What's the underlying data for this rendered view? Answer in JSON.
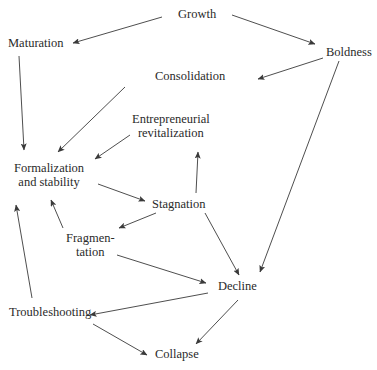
{
  "diagram": {
    "type": "directed-graph",
    "nodes": [
      {
        "id": "growth",
        "lines": [
          "Growth"
        ]
      },
      {
        "id": "maturation",
        "lines": [
          "Maturation"
        ]
      },
      {
        "id": "boldness",
        "lines": [
          "Boldness"
        ]
      },
      {
        "id": "consolidation",
        "lines": [
          "Consolidation"
        ]
      },
      {
        "id": "entrepreneurial",
        "lines": [
          "Entrepreneurial",
          "revitalization"
        ]
      },
      {
        "id": "formalization",
        "lines": [
          "Formalization",
          "and stability"
        ]
      },
      {
        "id": "stagnation",
        "lines": [
          "Stagnation"
        ]
      },
      {
        "id": "fragmentation",
        "lines": [
          "Fragmen-",
          "tation"
        ]
      },
      {
        "id": "decline",
        "lines": [
          "Decline"
        ]
      },
      {
        "id": "troubleshooting",
        "lines": [
          "Troubleshooting"
        ]
      },
      {
        "id": "collapse",
        "lines": [
          "Collapse"
        ]
      }
    ],
    "edges": [
      {
        "from": "growth",
        "to": "maturation"
      },
      {
        "from": "growth",
        "to": "boldness"
      },
      {
        "from": "boldness",
        "to": "consolidation"
      },
      {
        "from": "consolidation",
        "to": "formalization"
      },
      {
        "from": "maturation",
        "to": "formalization"
      },
      {
        "from": "entrepreneurial",
        "to": "formalization"
      },
      {
        "from": "formalization",
        "to": "stagnation"
      },
      {
        "from": "stagnation",
        "to": "entrepreneurial"
      },
      {
        "from": "stagnation",
        "to": "fragmentation"
      },
      {
        "from": "fragmentation",
        "to": "formalization"
      },
      {
        "from": "stagnation",
        "to": "decline"
      },
      {
        "from": "boldness",
        "to": "decline"
      },
      {
        "from": "fragmentation",
        "to": "decline"
      },
      {
        "from": "decline",
        "to": "troubleshooting"
      },
      {
        "from": "troubleshooting",
        "to": "formalization"
      },
      {
        "from": "troubleshooting",
        "to": "collapse"
      },
      {
        "from": "decline",
        "to": "collapse"
      }
    ],
    "colors": {
      "line": "#3a3a3a",
      "text": "#2a2a2a",
      "background": "#ffffff"
    }
  }
}
